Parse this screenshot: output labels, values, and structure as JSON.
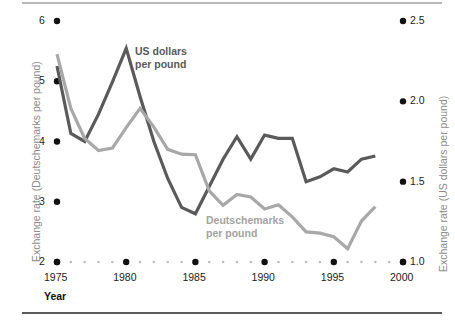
{
  "chart_data": {
    "type": "line",
    "title": "",
    "xlabel": "Year",
    "xlim": [
      1975,
      2000
    ],
    "xticks": [
      1975,
      1980,
      1985,
      1990,
      1995,
      2000
    ],
    "xtick_labels": [
      "1975",
      "1980",
      "1985",
      "1990",
      "1995",
      "2000"
    ],
    "grid": false,
    "legend_position": "inline-annotations",
    "axes": [
      {
        "id": "left",
        "label": "Exchange rate (Deutschemarks per pound)",
        "ylim": [
          2,
          6
        ],
        "yticks": [
          2,
          3,
          4,
          5,
          6
        ],
        "ytick_labels": [
          "2",
          "3",
          "4",
          "5",
          "6"
        ]
      },
      {
        "id": "right",
        "label": "Exchange rate (US dollars per pound)",
        "ylim": [
          1.0,
          2.5
        ],
        "yticks": [
          1.0,
          1.5,
          2.0,
          2.5
        ],
        "ytick_labels": [
          "1.0",
          "1.5",
          "2.0",
          "2.5"
        ]
      }
    ],
    "x": [
      1975,
      1976,
      1977,
      1978,
      1979,
      1980,
      1981,
      1982,
      1983,
      1984,
      1985,
      1986,
      1987,
      1988,
      1989,
      1990,
      1991,
      1992,
      1993,
      1994,
      1995,
      1996,
      1997,
      1998
    ],
    "series": [
      {
        "name": "US dollars per pound",
        "axis": "right",
        "color": "#5a5a5a",
        "label_text_line1": "US dollars",
        "label_text_line2": "per pound",
        "values": [
          2.22,
          1.8,
          1.75,
          1.92,
          2.12,
          2.33,
          2.03,
          1.75,
          1.52,
          1.34,
          1.3,
          1.47,
          1.64,
          1.78,
          1.64,
          1.79,
          1.77,
          1.77,
          1.5,
          1.53,
          1.58,
          1.56,
          1.64,
          1.66
        ]
      },
      {
        "name": "Deutschemarks per pound",
        "axis": "left",
        "color": "#a8a8a8",
        "label_text_line1": "Deutschemarks",
        "label_text_line2": "per pound",
        "values": [
          5.45,
          4.55,
          4.05,
          3.85,
          3.89,
          4.23,
          4.55,
          4.24,
          3.87,
          3.79,
          3.78,
          3.18,
          2.94,
          3.12,
          3.08,
          2.88,
          2.95,
          2.75,
          2.5,
          2.48,
          2.42,
          2.22,
          2.68,
          2.92
        ]
      }
    ]
  },
  "figure": {
    "x_axis_name": "Year"
  }
}
